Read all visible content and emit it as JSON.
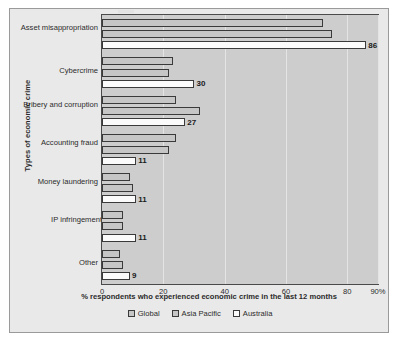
{
  "chart_data": {
    "type": "bar",
    "orientation": "horizontal",
    "title": "",
    "subtitle": "",
    "xlabel": "% respondents who experienced economic crime in the last 12 months",
    "ylabel": "Types of economic crime",
    "categories": [
      "Asset misappropriation",
      "Cybercrime",
      "Bribery and corruption",
      "Accounting fraud",
      "Money laundering",
      "IP infringement",
      "Other"
    ],
    "series": [
      {
        "name": "Global",
        "color": "#c6c6c6",
        "values": [
          72,
          23,
          24,
          24,
          9,
          7,
          6
        ]
      },
      {
        "name": "Asia Pacific",
        "color": "#c6c6c6",
        "values": [
          75,
          22,
          32,
          22,
          10,
          7,
          7
        ]
      },
      {
        "name": "Australia",
        "color": "#fbfbfb",
        "values": [
          86,
          30,
          27,
          11,
          11,
          11,
          9
        ]
      }
    ],
    "data_labels": {
      "series": "Australia",
      "values": [
        86,
        30,
        27,
        11,
        11,
        11,
        9
      ]
    },
    "xlim": [
      0,
      90
    ],
    "xticks": [
      0,
      20,
      40,
      60,
      80,
      90
    ],
    "xtick_labels": [
      "0",
      "20",
      "40",
      "60",
      "80",
      "90%"
    ],
    "grid": "vertical",
    "legend_position": "bottom",
    "legend_entries": [
      "Global",
      "Asia Pacific",
      "Australia"
    ],
    "plot_background": "#cdcdcd",
    "figure_background": "#e9e9e9"
  }
}
